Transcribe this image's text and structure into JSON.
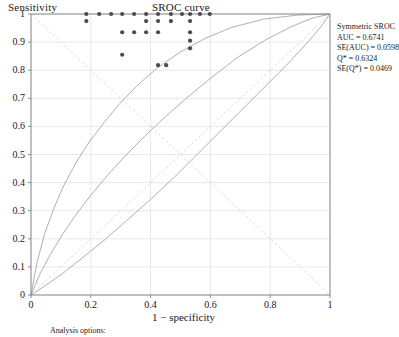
{
  "chart_data": {
    "type": "scatter",
    "title": "SROC curve",
    "xlabel": "1 − specificity",
    "ylabel": "Sensitivity",
    "xlim": [
      0,
      1
    ],
    "ylim": [
      0,
      1
    ],
    "grid": true,
    "xticks": [
      "0",
      "0.2",
      "0.4",
      "0.6",
      "0.8",
      "1"
    ],
    "xtick_values": [
      0,
      0.2,
      0.4,
      0.6,
      0.8,
      1
    ],
    "yticks": [
      "0",
      "0.1",
      "0.2",
      "0.3",
      "0.4",
      "0.5",
      "0.6",
      "0.7",
      "0.8",
      "0.9",
      "1"
    ],
    "ytick_values": [
      0,
      0.1,
      0.2,
      0.3,
      0.4,
      0.5,
      0.6,
      0.7,
      0.8,
      0.9,
      1
    ],
    "points": [
      [
        0.185,
        1.0
      ],
      [
        0.185,
        0.975
      ],
      [
        0.228,
        1.0
      ],
      [
        0.268,
        1.0
      ],
      [
        0.305,
        1.0
      ],
      [
        0.305,
        0.935
      ],
      [
        0.305,
        0.855
      ],
      [
        0.345,
        1.0
      ],
      [
        0.345,
        0.935
      ],
      [
        0.385,
        1.0
      ],
      [
        0.385,
        0.975
      ],
      [
        0.385,
        0.935
      ],
      [
        0.425,
        1.0
      ],
      [
        0.425,
        0.975
      ],
      [
        0.425,
        0.935
      ],
      [
        0.425,
        0.818
      ],
      [
        0.452,
        0.818
      ],
      [
        0.468,
        1.0
      ],
      [
        0.468,
        0.975
      ],
      [
        0.505,
        1.0
      ],
      [
        0.532,
        1.0
      ],
      [
        0.532,
        0.975
      ],
      [
        0.532,
        0.935
      ],
      [
        0.532,
        0.905
      ],
      [
        0.532,
        0.878
      ],
      [
        0.565,
        1.0
      ],
      [
        0.598,
        1.0
      ]
    ],
    "curves": [
      {
        "name": "sroc-upper",
        "style": "solid-thin",
        "points": [
          [
            0,
            0
          ],
          [
            0.02,
            0.115
          ],
          [
            0.045,
            0.215
          ],
          [
            0.075,
            0.305
          ],
          [
            0.11,
            0.39
          ],
          [
            0.15,
            0.47
          ],
          [
            0.195,
            0.545
          ],
          [
            0.245,
            0.615
          ],
          [
            0.3,
            0.685
          ],
          [
            0.36,
            0.75
          ],
          [
            0.425,
            0.81
          ],
          [
            0.5,
            0.865
          ],
          [
            0.58,
            0.912
          ],
          [
            0.67,
            0.952
          ],
          [
            0.78,
            0.982
          ],
          [
            0.89,
            0.996
          ],
          [
            1,
            1
          ]
        ]
      },
      {
        "name": "sroc-main",
        "style": "solid-thin",
        "points": [
          [
            0,
            0
          ],
          [
            0.03,
            0.075
          ],
          [
            0.065,
            0.145
          ],
          [
            0.105,
            0.215
          ],
          [
            0.15,
            0.285
          ],
          [
            0.2,
            0.355
          ],
          [
            0.255,
            0.425
          ],
          [
            0.315,
            0.495
          ],
          [
            0.38,
            0.565
          ],
          [
            0.45,
            0.635
          ],
          [
            0.525,
            0.705
          ],
          [
            0.605,
            0.775
          ],
          [
            0.69,
            0.845
          ],
          [
            0.78,
            0.905
          ],
          [
            0.87,
            0.955
          ],
          [
            0.94,
            0.985
          ],
          [
            1,
            1
          ]
        ]
      },
      {
        "name": "sroc-lower",
        "style": "solid-thin",
        "points": [
          [
            0,
            0
          ],
          [
            0.05,
            0.035
          ],
          [
            0.11,
            0.08
          ],
          [
            0.175,
            0.135
          ],
          [
            0.245,
            0.195
          ],
          [
            0.32,
            0.265
          ],
          [
            0.4,
            0.34
          ],
          [
            0.48,
            0.42
          ],
          [
            0.56,
            0.505
          ],
          [
            0.64,
            0.59
          ],
          [
            0.72,
            0.675
          ],
          [
            0.8,
            0.76
          ],
          [
            0.87,
            0.835
          ],
          [
            0.93,
            0.905
          ],
          [
            0.97,
            0.955
          ],
          [
            1,
            1
          ]
        ]
      },
      {
        "name": "diagonal-reference",
        "style": "dashed-light",
        "points": [
          [
            0,
            1
          ],
          [
            1,
            0
          ]
        ]
      },
      {
        "name": "identity-reference",
        "style": "dashed-light",
        "points": [
          [
            0,
            0
          ],
          [
            1,
            1
          ]
        ]
      }
    ],
    "annotations": {
      "heading": "Symmetric SROC",
      "lines": [
        "AUC = 0.6741",
        "SE(AUC) = 0.0598",
        "Q* = 0.6324",
        "SE(Q*) = 0.0469"
      ]
    },
    "footer_note": "Analysis options:",
    "colors": {
      "point": "#4a4a52",
      "curve": "#9a9aa2",
      "grid": "#d8d8dc",
      "axis": "#808088",
      "text": "#1a1a1a"
    }
  }
}
